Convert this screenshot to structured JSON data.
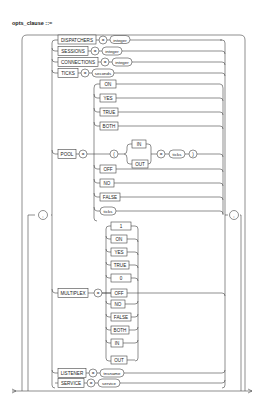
{
  "title": "opts_clause ::=",
  "separator": ",",
  "options": [
    {
      "keyword": "DISPATCHERS",
      "op": "=",
      "value": "integer"
    },
    {
      "keyword": "SESSIONS",
      "op": "=",
      "value": "integer"
    },
    {
      "keyword": "CONNECTIONS",
      "op": "=",
      "value": "integer"
    },
    {
      "keyword": "TICKS",
      "op": "=",
      "value": "seconds"
    }
  ],
  "pool": {
    "keyword": "POOL",
    "op": "=",
    "choices_top": [
      "ON",
      "YES",
      "TRUE",
      "BOTH"
    ],
    "paren_open": "(",
    "direction": [
      "IN",
      "OUT"
    ],
    "op2": "=",
    "ticks": "ticks",
    "paren_close": ")",
    "choices_bottom": [
      "OFF",
      "NO",
      "FALSE"
    ],
    "ticks_alone": "ticks"
  },
  "multiplex": {
    "keyword": "MULTIPLEX",
    "op": "=",
    "choices": [
      "1",
      "ON",
      "YES",
      "TRUE",
      "0",
      "OFF",
      "NO",
      "FALSE",
      "BOTH",
      "IN",
      "OUT"
    ]
  },
  "listener": {
    "keyword": "LISTENER",
    "op": "=",
    "value": "tnsname"
  },
  "service": {
    "keyword": "SERVICE",
    "op": "=",
    "value": "service"
  }
}
